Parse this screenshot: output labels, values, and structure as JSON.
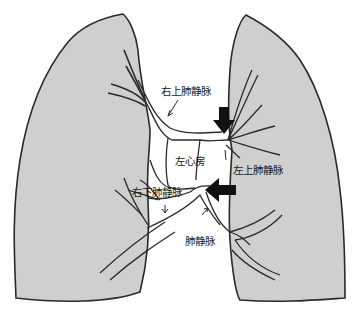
{
  "diagram": {
    "type": "anatomical-schematic",
    "colors": {
      "lung_fill": "#cfcfcf",
      "outline": "#2a2a2a",
      "background": "#ffffff",
      "arrow_fill": "#111111"
    },
    "labels": {
      "right_upper_pv": "右上肺静脉",
      "left_atrium": "左心房",
      "left_upper_pv": "左上肺静脉",
      "right_lower_pv": "右下肺静脉",
      "pulmonary_vein": "肺静脉"
    },
    "markers": [
      {
        "name": "arrow-down",
        "target": "left upper pulmonary vein ostium"
      },
      {
        "name": "arrow-left",
        "target": "left lower pulmonary vein ostium"
      }
    ]
  }
}
